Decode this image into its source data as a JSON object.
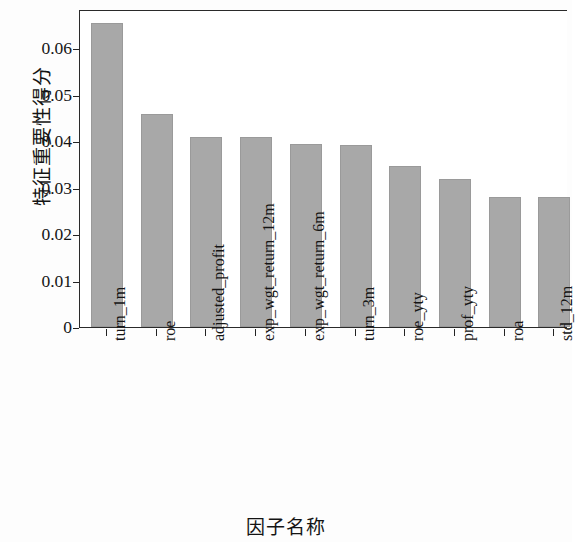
{
  "chart_data": {
    "type": "bar",
    "title": "",
    "xlabel": "因子名称",
    "ylabel": "特征重要性得分",
    "categories": [
      "turn_1m",
      "roe",
      "adjusted_profit",
      "exp_wgt_return_12m",
      "exp_wgt_return_6m",
      "turn_3m",
      "roe_yty",
      "prof_yty",
      "roa",
      "std_12m"
    ],
    "values": [
      0.0654,
      0.0458,
      0.0409,
      0.0409,
      0.0393,
      0.0391,
      0.0347,
      0.0318,
      0.028,
      0.0279
    ],
    "ylim": [
      0,
      0.0684
    ],
    "yticks": [
      0,
      0.01,
      0.02,
      0.03,
      0.04,
      0.05,
      0.06
    ],
    "ytick_labels": [
      "0",
      "0.01",
      "0.02",
      "0.03",
      "0.04",
      "0.05",
      "0.06"
    ],
    "grid": false,
    "legend": false,
    "bar_color": "#a8a8a8",
    "axis_color": "#2a2a2a"
  }
}
